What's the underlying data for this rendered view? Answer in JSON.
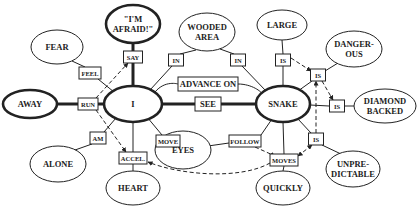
{
  "diagram": {
    "type": "conceptual-graph",
    "concepts": {
      "fear": {
        "lines": [
          "FEAR"
        ],
        "x": 57,
        "y": 47,
        "rx": 26,
        "ry": 17,
        "bold": false
      },
      "afraid": {
        "lines": [
          "\"I'M",
          "AFRAID!\""
        ],
        "x": 133,
        "y": 24,
        "rx": 27,
        "ry": 19,
        "bold": true
      },
      "wooded": {
        "lines": [
          "WOODED",
          "AREA"
        ],
        "x": 207,
        "y": 32,
        "rx": 28,
        "ry": 19,
        "bold": false
      },
      "large": {
        "lines": [
          "LARGE"
        ],
        "x": 282,
        "y": 25,
        "rx": 25,
        "ry": 15,
        "bold": false
      },
      "dangerous": {
        "lines": [
          "DANGER-",
          "OUS"
        ],
        "x": 354,
        "y": 49,
        "rx": 28,
        "ry": 18,
        "bold": false
      },
      "diamond": {
        "lines": [
          "DIAMOND",
          "BACKED"
        ],
        "x": 385,
        "y": 106,
        "rx": 31,
        "ry": 17,
        "bold": false
      },
      "unpredictable": {
        "lines": [
          "UNPRE-",
          "DICTABLE"
        ],
        "x": 353,
        "y": 169,
        "rx": 27,
        "ry": 18,
        "bold": false
      },
      "quickly": {
        "lines": [
          "QUICKLY"
        ],
        "x": 283,
        "y": 188,
        "rx": 27,
        "ry": 17,
        "bold": false
      },
      "heart": {
        "lines": [
          "HEART"
        ],
        "x": 133,
        "y": 188,
        "rx": 27,
        "ry": 17,
        "bold": false
      },
      "alone": {
        "lines": [
          "ALONE"
        ],
        "x": 58,
        "y": 164,
        "rx": 28,
        "ry": 18,
        "bold": false
      },
      "eyes": {
        "lines": [
          "EYES"
        ],
        "x": 183,
        "y": 150,
        "rx": 28,
        "ry": 19,
        "bold": false
      },
      "away": {
        "lines": [
          "AWAY"
        ],
        "x": 30,
        "y": 104,
        "rx": 27,
        "ry": 14,
        "bold": true
      },
      "i": {
        "lines": [
          "I"
        ],
        "x": 133,
        "y": 104,
        "rx": 29,
        "ry": 18,
        "bold": true
      },
      "snake": {
        "lines": [
          "SNAKE"
        ],
        "x": 283,
        "y": 104,
        "rx": 27,
        "ry": 18,
        "bold": true
      }
    },
    "relations": {
      "say": {
        "label": "SAY",
        "x": 133,
        "y": 57,
        "w": 19,
        "h": 12
      },
      "feel": {
        "label": "FEEL",
        "x": 90,
        "y": 73,
        "w": 22,
        "h": 12
      },
      "in1": {
        "label": "IN",
        "x": 176,
        "y": 60,
        "w": 15,
        "h": 12
      },
      "in2": {
        "label": "IN",
        "x": 238,
        "y": 60,
        "w": 15,
        "h": 12
      },
      "is_large": {
        "label": "IS",
        "x": 283,
        "y": 60,
        "w": 15,
        "h": 12
      },
      "is_danger": {
        "label": "IS",
        "x": 318,
        "y": 75,
        "w": 15,
        "h": 12
      },
      "is_diamond": {
        "label": "IS",
        "x": 337,
        "y": 106,
        "w": 15,
        "h": 12
      },
      "is_unpred": {
        "label": "IS",
        "x": 316,
        "y": 139,
        "w": 15,
        "h": 12
      },
      "run": {
        "label": "RUN",
        "x": 88,
        "y": 104,
        "w": 20,
        "h": 12
      },
      "see": {
        "label": "SEE",
        "x": 208,
        "y": 104,
        "w": 26,
        "h": 14
      },
      "advance": {
        "label": "ADVANCE ON",
        "x": 208,
        "y": 84,
        "w": 60,
        "h": 14
      },
      "am": {
        "label": "AM",
        "x": 98,
        "y": 138,
        "w": 16,
        "h": 12
      },
      "accel": {
        "label": "ACCEL.",
        "x": 133,
        "y": 158,
        "w": 28,
        "h": 12
      },
      "move": {
        "label": "MOVE",
        "x": 168,
        "y": 141,
        "w": 24,
        "h": 12
      },
      "follow": {
        "label": "FOLLOW",
        "x": 245,
        "y": 141,
        "w": 32,
        "h": 12
      },
      "moves": {
        "label": "MOVES",
        "x": 284,
        "y": 160,
        "w": 28,
        "h": 12
      }
    }
  }
}
